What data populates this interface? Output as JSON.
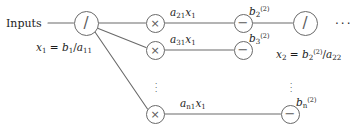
{
  "figure": {
    "background": "#ffffff",
    "stroke_color": "#6a6a6a",
    "text_color": "#1c1c1c",
    "width": 362,
    "height": 133
  },
  "labels": {
    "inputs": "Inputs",
    "x1_equation_plain": "x1 = b1/a11",
    "x2_equation_plain": "x2 = b2(2)/a22",
    "edge_a21x1": "a21x1",
    "edge_a31x1": "a31x1",
    "edge_an1x1": "an1x1",
    "edge_b2": "b2(2)",
    "edge_b3": "b3(2)",
    "edge_bn": "bn(2)",
    "trailing_ellipsis": "···"
  },
  "nodes": [
    {
      "id": "div-left",
      "op": "divide",
      "glyph": "/",
      "cx": 86,
      "cy": 23,
      "r": 12.5
    },
    {
      "id": "mul-1",
      "op": "multiply",
      "glyph": "×",
      "cx": 155,
      "cy": 23,
      "r": 9.5
    },
    {
      "id": "mul-2",
      "op": "multiply",
      "glyph": "×",
      "cx": 155,
      "cy": 50,
      "r": 9.5
    },
    {
      "id": "mul-n",
      "op": "multiply",
      "glyph": "×",
      "cx": 155,
      "cy": 114,
      "r": 9.5
    },
    {
      "id": "sub-1",
      "op": "subtract",
      "glyph": "−",
      "cx": 243,
      "cy": 23,
      "r": 9.5
    },
    {
      "id": "sub-2",
      "op": "subtract",
      "glyph": "−",
      "cx": 243,
      "cy": 50,
      "r": 9.5
    },
    {
      "id": "sub-n",
      "op": "subtract",
      "glyph": "−",
      "cx": 290,
      "cy": 114,
      "r": 9.5
    },
    {
      "id": "div-right",
      "op": "divide",
      "glyph": "/",
      "cx": 305,
      "cy": 23,
      "r": 12.5
    }
  ],
  "edges": [
    {
      "from": "inputs",
      "to": "div-left",
      "label": ""
    },
    {
      "from": "div-left",
      "to": "mul-1",
      "label": ""
    },
    {
      "from": "div-left",
      "to": "mul-2",
      "label": ""
    },
    {
      "from": "div-left",
      "to": "mul-n",
      "label": ""
    },
    {
      "from": "mul-1",
      "to": "sub-1",
      "label": "a21x1"
    },
    {
      "from": "mul-2",
      "to": "sub-2",
      "label": "a31x1"
    },
    {
      "from": "mul-n",
      "to": "sub-n",
      "label": "an1x1"
    },
    {
      "from": "sub-1",
      "to": "div-right",
      "label": "b2(2)"
    }
  ],
  "ellipses": {
    "vertical_left_x": 156,
    "vertical_left_y": 86,
    "vertical_right_x": 291,
    "vertical_right_y": 86,
    "horizontal_right": "···"
  }
}
